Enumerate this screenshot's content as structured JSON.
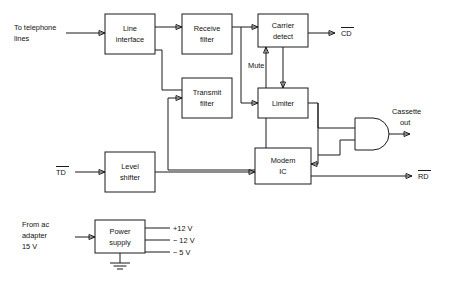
{
  "diagram": {
    "blocks": [
      {
        "id": "line-interface",
        "label1": "Line",
        "label2": "interface"
      },
      {
        "id": "receive-filter",
        "label1": "Receive",
        "label2": "filter"
      },
      {
        "id": "carrier-detect",
        "label1": "Carrier",
        "label2": "detect"
      },
      {
        "id": "transmit-filter",
        "label1": "Transmit",
        "label2": "filter"
      },
      {
        "id": "limiter",
        "label1": "Limiter",
        "label2": ""
      },
      {
        "id": "modem-ic",
        "label1": "Modem",
        "label2": "IC"
      },
      {
        "id": "level-shifter",
        "label1": "Level",
        "label2": "shifter"
      },
      {
        "id": "power-supply",
        "label1": "Power",
        "label2": "supply"
      }
    ],
    "labels": {
      "to_telephone_lines_1": "To telephone",
      "to_telephone_lines_2": "lines",
      "cd_output": "CD",
      "mute": "Mute",
      "cassette_out_1": "Cassette",
      "cassette_out_2": "out",
      "td_input": "TD",
      "rd_output": "RD",
      "from_ac_adapter_1": "From ac",
      "from_ac_adapter_2": "adapter",
      "from_ac_adapter_3": "15 V",
      "rail_plus12": "+12 V",
      "rail_minus12": "− 12 V",
      "rail_minus5": "− 5 V"
    },
    "colors": {
      "line": "#1a1a1a",
      "block_fill": "#ffffff",
      "background": "#ffffff",
      "text": "#111111"
    }
  }
}
